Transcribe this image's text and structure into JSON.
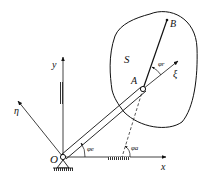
{
  "diagram": {
    "body_label": "S",
    "points": {
      "origin": "O",
      "joint": "A",
      "end": "B"
    },
    "axes": {
      "x": "x",
      "y": "y",
      "eta": "η",
      "xi": "ξ"
    },
    "angles": {
      "phi_e_at_O": "φe",
      "phi_r_at_A": "φr",
      "phi_a": "φa"
    },
    "colors": {
      "ink": "#111111",
      "background": "#ffffff"
    }
  }
}
